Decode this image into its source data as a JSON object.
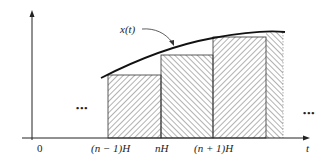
{
  "diagram": {
    "type": "staircase-approximation",
    "curve_label": "x(t)",
    "axis": {
      "x_label": "t",
      "origin_label": "0"
    },
    "tick_labels": [
      "(n − 1)H",
      "nH",
      "(n + 1)H"
    ],
    "ellipsis_left": "•••",
    "ellipsis_right": "•••",
    "rectangles": [
      {
        "x0": 108,
        "x1": 161,
        "top": 75,
        "hatch": "forward"
      },
      {
        "x0": 161,
        "x1": 213,
        "top": 55,
        "hatch": "backward"
      },
      {
        "x0": 213,
        "x1": 266,
        "top": 37,
        "hatch": "forward"
      }
    ],
    "colors": {
      "stroke": "#222222",
      "hatch": "#555555",
      "background": "#ffffff"
    }
  }
}
